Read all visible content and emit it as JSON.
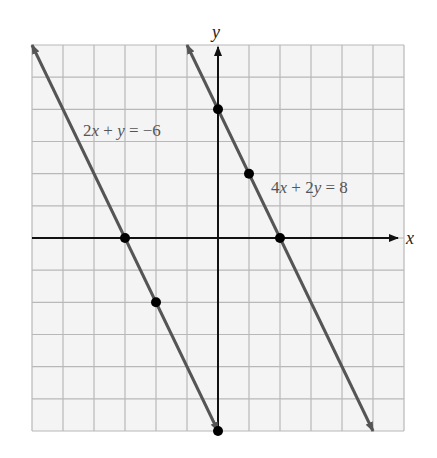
{
  "chart_data": {
    "type": "line",
    "title": "",
    "xlabel": "x",
    "ylabel": "y",
    "xlim": [
      -6,
      6
    ],
    "ylim": [
      -6,
      6
    ],
    "grid": true,
    "grid_step": 1,
    "legend": null,
    "series": [
      {
        "name": "2x + y = −6",
        "equation": "2x + y = -6",
        "slope": -2,
        "intercept": -6,
        "marked_points": [
          [
            -3,
            0
          ],
          [
            -2,
            -2
          ],
          [
            0,
            -6
          ]
        ],
        "color": "#555555",
        "label_position": [
          -4.5,
          3.4
        ]
      },
      {
        "name": "4x + 2y = 8",
        "equation": "4x + 2y = 8",
        "slope": -2,
        "intercept": 4,
        "marked_points": [
          [
            0,
            4
          ],
          [
            1,
            2
          ],
          [
            2,
            0
          ]
        ],
        "color": "#555555",
        "label_position": [
          1.8,
          1.5
        ]
      }
    ],
    "annotations": [
      {
        "text": "2x + y = −6",
        "x": -4.5,
        "y": 3.4
      },
      {
        "text": "4x + 2y = 8",
        "x": 1.8,
        "y": 1.5
      }
    ]
  },
  "labels": {
    "x_axis": "x",
    "y_axis": "y",
    "eq1_coef": "2",
    "eq1_var1": "x",
    "eq1_op": " + ",
    "eq1_var2": "y",
    "eq1_rhs": " = −6",
    "eq2_coef1": "4",
    "eq2_var1": "x",
    "eq2_op": " + 2",
    "eq2_var2": "y",
    "eq2_rhs": " = 8"
  },
  "colors": {
    "grid": "#b8b8b8",
    "grid_bg": "#f4f4f4",
    "axes": "#111111",
    "line": "#555555",
    "point": "#000000"
  }
}
